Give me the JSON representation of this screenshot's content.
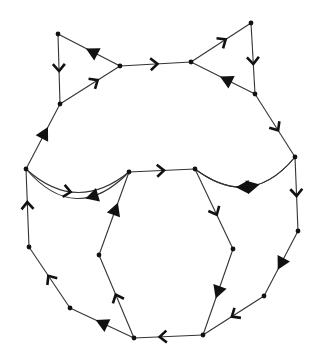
{
  "diagram": {
    "type": "directed-graph",
    "colors": {
      "stroke": "#333333",
      "node": "#111111",
      "arrow": "#111111",
      "background": "#ffffff"
    },
    "nodes": [
      {
        "id": "n0",
        "x": 58,
        "y": 34
      },
      {
        "id": "n1",
        "x": 120,
        "y": 66
      },
      {
        "id": "n2",
        "x": 60,
        "y": 104
      },
      {
        "id": "n3",
        "x": 191,
        "y": 62
      },
      {
        "id": "n4",
        "x": 251,
        "y": 23
      },
      {
        "id": "n5",
        "x": 255,
        "y": 94
      },
      {
        "id": "n6",
        "x": 26,
        "y": 169
      },
      {
        "id": "n7",
        "x": 129,
        "y": 172
      },
      {
        "id": "n8",
        "x": 195,
        "y": 169
      },
      {
        "id": "n9",
        "x": 295,
        "y": 157
      },
      {
        "id": "n10",
        "x": 29,
        "y": 247
      },
      {
        "id": "n11",
        "x": 70,
        "y": 308
      },
      {
        "id": "n12",
        "x": 99,
        "y": 255
      },
      {
        "id": "n13",
        "x": 134,
        "y": 338
      },
      {
        "id": "n14",
        "x": 233,
        "y": 249
      },
      {
        "id": "n15",
        "x": 298,
        "y": 231
      },
      {
        "id": "n16",
        "x": 264,
        "y": 296
      },
      {
        "id": "n17",
        "x": 203,
        "y": 335
      }
    ],
    "edges": [
      {
        "from": "n1",
        "to": "n0",
        "arrow": "triangle",
        "t": 0.45
      },
      {
        "from": "n0",
        "to": "n2",
        "arrow": "chevron",
        "t": 0.5
      },
      {
        "from": "n2",
        "to": "n1",
        "arrow": "chevron",
        "t": 0.6
      },
      {
        "from": "n1",
        "to": "n3",
        "arrow": "chevron",
        "t": 0.5
      },
      {
        "from": "n3",
        "to": "n4",
        "arrow": "chevron",
        "t": 0.55
      },
      {
        "from": "n4",
        "to": "n5",
        "arrow": "chevron",
        "t": 0.55
      },
      {
        "from": "n5",
        "to": "n3",
        "arrow": "triangle",
        "t": 0.45
      },
      {
        "from": "n6",
        "to": "n2",
        "arrow": "triangle",
        "t": 0.55
      },
      {
        "from": "n5",
        "to": "n9",
        "arrow": "chevron",
        "t": 0.55
      },
      {
        "from": "n7",
        "to": "n6",
        "arrow": "triangle",
        "t": 0.35,
        "curve": -28
      },
      {
        "from": "n6",
        "to": "n7",
        "arrow": "chevron",
        "t": 0.42,
        "curve": 22
      },
      {
        "from": "n7",
        "to": "n8",
        "arrow": "chevron",
        "t": 0.5
      },
      {
        "from": "n9",
        "to": "n8",
        "arrow": "triangle",
        "t": 0.55,
        "curve": -24
      },
      {
        "from": "n8",
        "to": "n9",
        "arrow": "triangle",
        "t": 0.55,
        "curve": 24
      },
      {
        "from": "n10",
        "to": "n6",
        "arrow": "chevron",
        "t": 0.55
      },
      {
        "from": "n11",
        "to": "n10",
        "arrow": "chevron",
        "t": 0.5
      },
      {
        "from": "n13",
        "to": "n11",
        "arrow": "triangle",
        "t": 0.5
      },
      {
        "from": "n12",
        "to": "n7",
        "arrow": "triangle",
        "t": 0.55
      },
      {
        "from": "n13",
        "to": "n12",
        "arrow": "chevron",
        "t": 0.5
      },
      {
        "from": "n17",
        "to": "n13",
        "arrow": "chevron",
        "t": 0.6
      },
      {
        "from": "n8",
        "to": "n14",
        "arrow": "chevron",
        "t": 0.55
      },
      {
        "from": "n14",
        "to": "n17",
        "arrow": "triangle",
        "t": 0.5
      },
      {
        "from": "n9",
        "to": "n15",
        "arrow": "chevron",
        "t": 0.5
      },
      {
        "from": "n15",
        "to": "n16",
        "arrow": "triangle",
        "t": 0.5
      },
      {
        "from": "n16",
        "to": "n17",
        "arrow": "chevron",
        "t": 0.5
      }
    ]
  }
}
